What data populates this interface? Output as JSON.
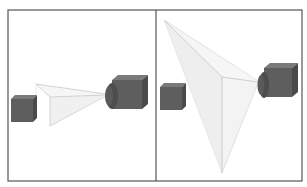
{
  "figure": {
    "panels": [
      {
        "id": "left",
        "description": "Camera viewing frustum with small cube outside near frustum",
        "objects": [
          "small-cube",
          "view-frustum",
          "camera"
        ]
      },
      {
        "id": "right",
        "description": "Camera with wide viewing frustum, cube inside frustum",
        "objects": [
          "small-cube",
          "view-frustum",
          "camera"
        ]
      }
    ],
    "colors": {
      "background": "#ffffff",
      "frame": "#555555",
      "cube_front": "#5e5e5e",
      "cube_top": "#7a7a7a",
      "cube_side": "#4a4a4a",
      "frustum_fill": "#eeeeee",
      "frustum_edge": "#bdbdbd"
    }
  }
}
